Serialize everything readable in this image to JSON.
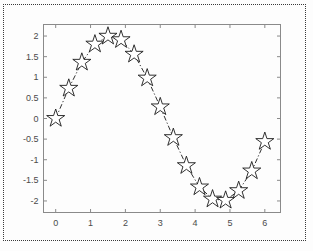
{
  "figure": {
    "background_color": "#fdfdfd",
    "border_style": "dotted",
    "border_color": "#3a3a3a",
    "axis_color": "#8a8a8a",
    "data_color": "#1a1a1a"
  },
  "chart_data": {
    "type": "line",
    "title": "",
    "xlabel": "",
    "ylabel": "",
    "xlim": [
      -0.35,
      6.45
    ],
    "ylim": [
      -2.28,
      2.28
    ],
    "xticks": [
      0,
      1,
      2,
      3,
      4,
      5,
      6
    ],
    "xticklabels": [
      "0",
      "1",
      "2",
      "3",
      "4",
      "5",
      "6"
    ],
    "yticks": [
      2,
      1.5,
      1,
      0.5,
      0,
      -0.5,
      -1,
      -1.5,
      -2
    ],
    "yticklabels": [
      "2",
      "1.5",
      "1",
      "0.5",
      "0",
      "-0.5",
      "-1",
      "-1.5",
      "-2"
    ],
    "grid": false,
    "legend": null,
    "linestyle": "dash-dot",
    "marker": "pentagram-star",
    "marker_filled": false,
    "series": [
      {
        "name": "2*sin(x)",
        "x": [
          0.0,
          0.375,
          0.75,
          1.125,
          1.5,
          1.875,
          2.25,
          2.625,
          3.0,
          3.375,
          3.75,
          4.125,
          4.5,
          4.875,
          5.25,
          5.625,
          6.0
        ],
        "y": [
          0.0,
          0.732,
          1.363,
          1.804,
          1.995,
          1.911,
          1.558,
          0.98,
          0.282,
          -0.464,
          -1.144,
          -1.661,
          -1.955,
          -1.985,
          -1.75,
          -1.273,
          -0.559
        ]
      }
    ]
  }
}
